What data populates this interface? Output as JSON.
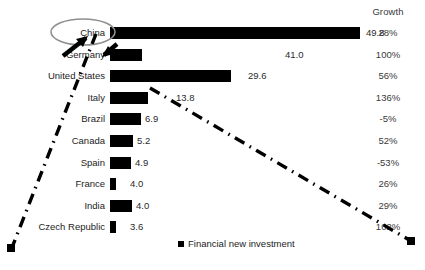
{
  "chart_data": {
    "type": "bar",
    "title": "",
    "xlabel": "",
    "ylabel": "",
    "value_column_header": "",
    "growth_column_header": "Growth",
    "legend": {
      "position": "bottom-center",
      "entries": [
        {
          "label": "Financial new investment",
          "marker": "square",
          "color": "#000000"
        }
      ]
    },
    "grid": false,
    "orientation": "horizontal",
    "categories": [
      "China",
      "Germany",
      "United States",
      "Italy",
      "Brazil",
      "Canada",
      "Spain",
      "France",
      "India",
      "Czech Republic"
    ],
    "values": [
      49.8,
      41.0,
      29.6,
      13.8,
      6.9,
      5.2,
      4.9,
      4.0,
      4.0,
      3.6
    ],
    "value_labels": [
      "49.8",
      "41.0",
      "29.6",
      "13.8",
      "6.9",
      "5.2",
      "4.9",
      "4.0",
      "4.0",
      "3.6"
    ],
    "growth_labels": [
      "28%",
      "100%",
      "56%",
      "136%",
      "-5%",
      "52%",
      "-53%",
      "26%",
      "29%",
      "102%"
    ],
    "growth_values": [
      28,
      100,
      56,
      136,
      -5,
      52,
      -53,
      26,
      29,
      102
    ],
    "series": [
      {
        "name": "Financial new investment",
        "values": [
          49.8,
          41.0,
          29.6,
          13.8,
          6.9,
          5.2,
          4.9,
          4.0,
          4.0,
          3.6
        ]
      }
    ],
    "xlim": [
      0,
      49.8
    ],
    "bar_color": "#000000",
    "annotations": [
      {
        "type": "ellipse",
        "target": "China",
        "color": "#8c8c8c"
      },
      {
        "type": "arrow",
        "target": "China",
        "color": "#000000"
      },
      {
        "type": "dash-dot-line",
        "name": "left-trend-line",
        "color": "#000000"
      },
      {
        "type": "dash-dot-line",
        "name": "right-trend-line",
        "color": "#000000"
      }
    ]
  },
  "rows": [
    {
      "category": "China",
      "value_label": "49.8",
      "growth": "28%",
      "bar_px": 250,
      "label_x": 366
    },
    {
      "category": "Germany",
      "value_label": "41.0",
      "growth": "100%",
      "bar_px": 32,
      "label_x": 285
    },
    {
      "category": "United States",
      "value_label": "29.6",
      "growth": "56%",
      "bar_px": 121,
      "label_x": 248
    },
    {
      "category": "Italy",
      "value_label": "13.8",
      "growth": "136%",
      "bar_px": 38,
      "label_x": 176
    },
    {
      "category": "Brazil",
      "value_label": "6.9",
      "growth": "-5%",
      "bar_px": 31,
      "label_x": 145
    },
    {
      "category": "Canada",
      "value_label": "5.2",
      "growth": "52%",
      "bar_px": 23,
      "label_x": 137
    },
    {
      "category": "Spain",
      "value_label": "4.9",
      "growth": "-53%",
      "bar_px": 21,
      "label_x": 135
    },
    {
      "category": "France",
      "value_label": "4.0",
      "growth": "26%",
      "bar_px": 6,
      "label_x": 130
    },
    {
      "category": "India",
      "value_label": "4.0",
      "growth": "29%",
      "bar_px": 22,
      "label_x": 136
    },
    {
      "category": "Czech Republic",
      "value_label": "3.6",
      "growth": "102%",
      "bar_px": 6,
      "label_x": 130
    }
  ],
  "header": {
    "growth": "Growth"
  },
  "legend": {
    "label": "Financial new investment"
  }
}
